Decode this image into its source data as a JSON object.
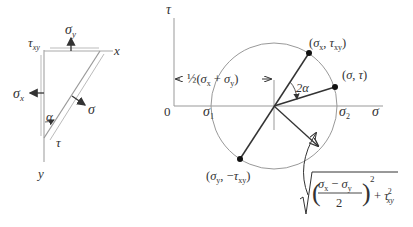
{
  "element_diagram": {
    "labels": {
      "sigma_y": "σ",
      "sigma_y_sub": "y",
      "tau_xy": "τ",
      "tau_xy_sub": "xy",
      "x_axis": "x",
      "y_axis": "y",
      "sigma_x": "σ",
      "sigma_x_sub": "x",
      "sigma": "σ",
      "tau": "τ",
      "alpha": "α"
    }
  },
  "mohr_circle": {
    "axes": {
      "tau_label": "τ",
      "sigma_label": "σ",
      "origin_label": "0"
    },
    "center_label": "←½(σ",
    "center_label_parts": [
      "←½(σ",
      "x",
      " + σ",
      "y",
      ")→"
    ],
    "sigma1_label": "σ",
    "sigma1_sub": "1",
    "sigma2_label": "σ",
    "sigma2_sub": "2",
    "points": {
      "p_xy": {
        "label_a": "(σ",
        "sub_a": "x",
        "label_b": ", τ",
        "sub_b": "xy",
        "label_c": ")"
      },
      "p_st": {
        "label": "(σ, τ)"
      },
      "p_yx": {
        "label_a": "(σ",
        "sub_a": "y",
        "label_b": ", −τ",
        "sub_b": "xy",
        "label_c": ")"
      }
    },
    "angle_label": "2α",
    "radius_formula": {
      "num_a": "σ",
      "num_a_sub": "x",
      "minus": " − ",
      "num_b": "σ",
      "num_b_sub": "y",
      "den": "2",
      "exp": "2",
      "plus": "+ τ",
      "tau_sup": "2",
      "tau_sub": "xy"
    }
  },
  "colors": {
    "line": "#333333",
    "light_line": "#999999",
    "circle": "#888888"
  }
}
